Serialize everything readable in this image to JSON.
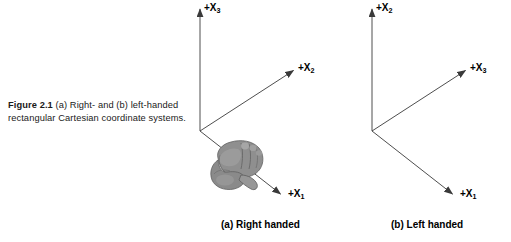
{
  "figure": {
    "caption_label": "Figure 2.1",
    "caption_text": "(a) Right- and (b) left-handed rectangular Cartesian coordinate systems."
  },
  "diagrams": [
    {
      "id": "right-handed",
      "sub_caption": "(a) Right handed",
      "hand_icon": "right-hand-icon",
      "axes": [
        {
          "name": "vertical",
          "label_prefix": "+X",
          "label_sub": "3"
        },
        {
          "name": "diagonal-up",
          "label_prefix": "+X",
          "label_sub": "2"
        },
        {
          "name": "diagonal-down",
          "label_prefix": "+X",
          "label_sub": "1"
        }
      ]
    },
    {
      "id": "left-handed",
      "sub_caption": "(b) Left handed",
      "hand_icon": null,
      "axes": [
        {
          "name": "vertical",
          "label_prefix": "+X",
          "label_sub": "2"
        },
        {
          "name": "diagonal-up",
          "label_prefix": "+X",
          "label_sub": "3"
        },
        {
          "name": "diagonal-down",
          "label_prefix": "+X",
          "label_sub": "1"
        }
      ]
    }
  ],
  "colors": {
    "background": "#ffffff",
    "axis_line": "#3a3a3a",
    "text": "#000000",
    "caption_text": "#1a1a1a",
    "hand_mid": "#8c8c8c",
    "hand_dark": "#5a5a5a",
    "hand_light": "#b5b5b5"
  }
}
